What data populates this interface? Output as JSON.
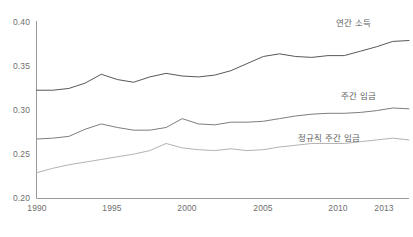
{
  "chart_data": {
    "type": "line",
    "title": "",
    "subtitle": "",
    "xlabel": "",
    "ylabel": "",
    "xlim": [
      1990,
      2013
    ],
    "ylim": [
      0.2,
      0.4
    ],
    "grid": false,
    "legend_position": "inline-right-of-series",
    "x": [
      1990,
      1991,
      1992,
      1993,
      1994,
      1995,
      1996,
      1997,
      1998,
      1999,
      2000,
      2001,
      2002,
      2003,
      2004,
      2005,
      2006,
      2007,
      2008,
      2009,
      2010,
      2011,
      2012,
      2013
    ],
    "xticks": [
      "1990",
      "1995",
      "2000",
      "2005",
      "2010",
      "2013"
    ],
    "xtick_values": [
      1990,
      1995,
      2000,
      2005,
      2010,
      2013
    ],
    "yticks": [
      "0.20",
      "0.25",
      "0.30",
      "0.35",
      "0.40"
    ],
    "ytick_values": [
      0.2,
      0.25,
      0.3,
      0.35,
      0.4
    ],
    "series": [
      {
        "name": "연간 소득",
        "color": "#585858",
        "values": [
          0.322,
          0.322,
          0.324,
          0.33,
          0.34,
          0.334,
          0.331,
          0.337,
          0.341,
          0.338,
          0.337,
          0.339,
          0.344,
          0.352,
          0.36,
          0.363,
          0.36,
          0.359,
          0.361,
          0.361,
          0.366,
          0.371,
          0.377,
          0.378
        ]
      },
      {
        "name": "주간 임금",
        "color": "#7d7d7d",
        "values": [
          0.267,
          0.268,
          0.27,
          0.278,
          0.284,
          0.28,
          0.277,
          0.277,
          0.28,
          0.29,
          0.284,
          0.283,
          0.286,
          0.286,
          0.287,
          0.29,
          0.293,
          0.295,
          0.296,
          0.296,
          0.297,
          0.299,
          0.302,
          0.301
        ]
      },
      {
        "name": "정규직 주간 임금",
        "color": "#b3b3b3",
        "values": [
          0.229,
          0.234,
          0.238,
          0.241,
          0.244,
          0.247,
          0.25,
          0.254,
          0.262,
          0.257,
          0.255,
          0.254,
          0.256,
          0.254,
          0.255,
          0.258,
          0.26,
          0.262,
          0.262,
          0.262,
          0.264,
          0.266,
          0.268,
          0.266
        ]
      }
    ]
  },
  "axis": {
    "y_labels": [
      "0.40",
      "0.35",
      "0.30",
      "0.25",
      "0.20"
    ],
    "x_labels": [
      "1990",
      "1995",
      "2000",
      "2005",
      "2010",
      "2013"
    ]
  },
  "labels": {
    "annual_income": "연간 소득",
    "weekly_wage": "주간 임금",
    "fulltime_weekly_wage": "정규직 주간 임금"
  },
  "colors": {
    "axis": "#9a9a9a",
    "tick_text": "#6f6f6f",
    "series_1": "#585858",
    "series_2": "#7d7d7d",
    "series_3": "#b3b3b3",
    "background": "#ffffff"
  }
}
